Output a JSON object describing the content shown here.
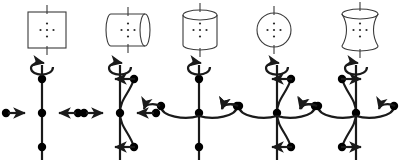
{
  "figure": {
    "type": "diagram",
    "width": 399,
    "height": 160,
    "background_color": "#ffffff",
    "line_color": "#1a1a1a",
    "shape_outline_color": "#3a3a3a",
    "dot_color": "#000000",
    "panels": [
      {
        "letter": "a",
        "letter_x": 14,
        "letter_y": 18,
        "shape": {
          "name": "square-box",
          "kind": "rect",
          "cx": 47,
          "cy": 30,
          "rx": 19,
          "ry": 18,
          "bulge": 0,
          "waist": 0,
          "dots": 5
        },
        "spin": {
          "cx": 42,
          "cy": 113,
          "axis_curved": false,
          "axis_dot_offset": 0,
          "axis_arrow_dir": "none",
          "horiz_arrow_style": "straight-inward",
          "rotation_arrow": true
        }
      },
      {
        "letter": "b",
        "letter_x": 90,
        "letter_y": 18,
        "shape": {
          "name": "horizontal-cylinder",
          "kind": "hcyl",
          "cx": 128,
          "cy": 30,
          "rx": 22,
          "ry": 16,
          "bulge": 7,
          "waist": 0,
          "dots": 5
        },
        "spin": {
          "cx": 120,
          "cy": 113,
          "axis_curved": true,
          "axis_dot_offset": 14,
          "axis_arrow_dir": "left",
          "horiz_arrow_style": "straight-inward",
          "rotation_arrow": true
        }
      },
      {
        "letter": "c",
        "letter_x": 168,
        "letter_y": 18,
        "shape": {
          "name": "vertical-cylinder",
          "kind": "vcyl",
          "cx": 200,
          "cy": 30,
          "rx": 17,
          "ry": 20,
          "bulge": 0,
          "waist": 0,
          "dots": 5
        },
        "spin": {
          "cx": 199,
          "cy": 113,
          "axis_curved": false,
          "axis_dot_offset": 0,
          "axis_arrow_dir": "none",
          "horiz_arrow_style": "curved-outward",
          "rotation_arrow": true
        }
      },
      {
        "letter": "d",
        "letter_x": 243,
        "letter_y": 18,
        "shape": {
          "name": "sphere-circle",
          "kind": "circle",
          "cx": 274,
          "cy": 30,
          "rx": 17,
          "ry": 17,
          "bulge": 0,
          "waist": 0,
          "dots": 5
        },
        "spin": {
          "cx": 277,
          "cy": 113,
          "axis_curved": true,
          "axis_dot_offset": 14,
          "axis_arrow_dir": "left",
          "horiz_arrow_style": "curved-outward",
          "rotation_arrow": true
        }
      },
      {
        "letter": "e",
        "letter_x": 330,
        "letter_y": 18,
        "shape": {
          "name": "hourglass-waisted-cylinder",
          "kind": "waist",
          "cx": 360,
          "cy": 30,
          "rx": 18,
          "ry": 21,
          "bulge": 0,
          "waist": 6,
          "dots": 5
        },
        "spin": {
          "cx": 356,
          "cy": 113,
          "axis_curved": true,
          "axis_dot_offset": -14,
          "axis_arrow_dir": "right",
          "horiz_arrow_style": "curved-outward",
          "rotation_arrow": true
        }
      }
    ],
    "geometry": {
      "axis_half_height": 48,
      "axis_dot_spacing": 34,
      "horiz_dot_distance": 36,
      "dot_radius": 4.2,
      "stroke_width": 2.2,
      "shape_stroke_width": 1.1,
      "inner_dot_radius": 1.1
    }
  }
}
